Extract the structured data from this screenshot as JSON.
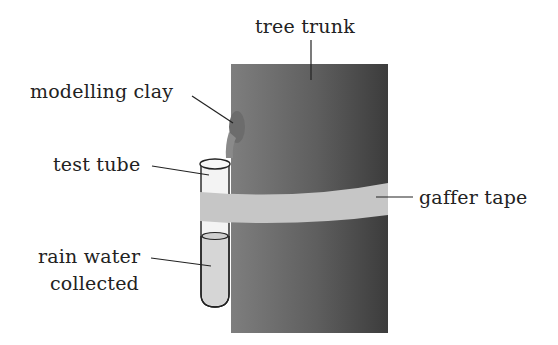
{
  "labels": {
    "tree_trunk": "tree trunk",
    "modelling_clay": "modelling clay",
    "test_tube": "test tube",
    "gaffer_tape": "gaffer tape",
    "rain_water_line1": "rain water",
    "rain_water_line2": "collected"
  },
  "colors": {
    "trunk_light": "#7a7a7a",
    "trunk_dark": "#3e3e3e",
    "tape": "#c4c4c4",
    "tube_glass": "#f2f2f2",
    "water": "#d8d8d8",
    "clay": "#6a6a6a",
    "text": "#222222"
  }
}
